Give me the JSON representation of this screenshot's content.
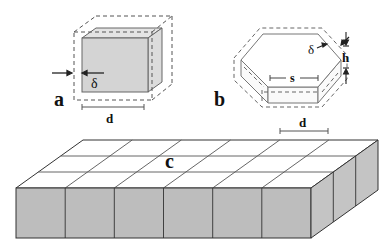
{
  "panels": {
    "a": {
      "label": "a",
      "delta": "δ",
      "dim": "d"
    },
    "b": {
      "label": "b",
      "delta": "δ",
      "side": "s",
      "height": "h"
    },
    "c": {
      "label": "c",
      "dim": "d",
      "columns": 6,
      "rows": 3
    }
  },
  "colors": {
    "face_front": "#bdbdbd",
    "face_side": "#c8c8c8",
    "face_top": "#ffffff",
    "cube_front": "#d6d6d6",
    "cube_side": "#dcdcdc",
    "line": "#444444"
  }
}
